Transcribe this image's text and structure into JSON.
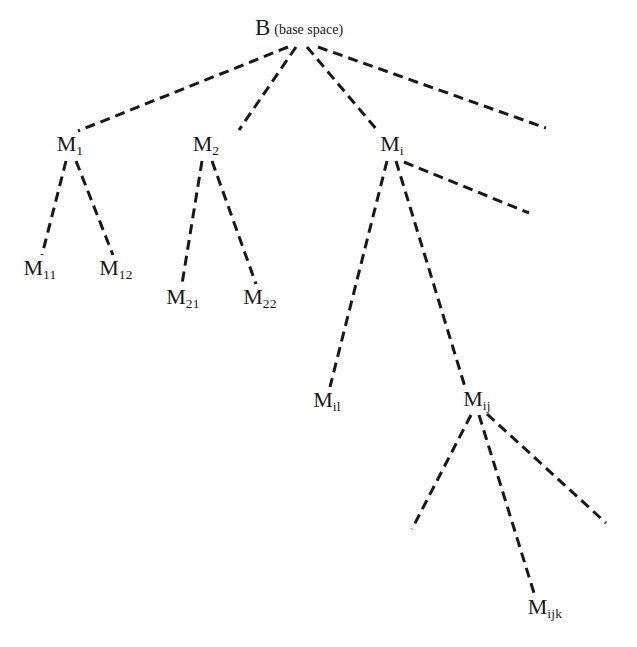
{
  "diagram": {
    "type": "tree",
    "background_color": "#ffffff",
    "edge_color": "#18181a",
    "text_color": "#18181a",
    "edge_style": "dashed",
    "edge_width": 3,
    "dash_pattern": "10 6"
  },
  "nodes": {
    "root": {
      "symbol": "B",
      "subscript": "",
      "annotation": "(base space)",
      "x": 299,
      "y": 27
    },
    "m1": {
      "symbol": "M",
      "subscript": "1",
      "annotation": "",
      "x": 70,
      "y": 145
    },
    "m2": {
      "symbol": "M",
      "subscript": "2",
      "annotation": "",
      "x": 206,
      "y": 145
    },
    "mi": {
      "symbol": "M",
      "subscript": "i",
      "annotation": "",
      "x": 392,
      "y": 145
    },
    "m11": {
      "symbol": "M",
      "subscript": "11",
      "annotation": "",
      "x": 40,
      "y": 269
    },
    "m12": {
      "symbol": "M",
      "subscript": "12",
      "annotation": "",
      "x": 116,
      "y": 269
    },
    "m21": {
      "symbol": "M",
      "subscript": "21",
      "annotation": "",
      "x": 183,
      "y": 298
    },
    "m22": {
      "symbol": "M",
      "subscript": "22",
      "annotation": "",
      "x": 260,
      "y": 298
    },
    "mil": {
      "symbol": "M",
      "subscript": "il",
      "annotation": "",
      "x": 327,
      "y": 401
    },
    "mij": {
      "symbol": "M",
      "subscript": "ij",
      "annotation": "",
      "x": 477,
      "y": 400
    },
    "mijk": {
      "symbol": "M",
      "subscript": "ijk",
      "annotation": "",
      "x": 545,
      "y": 608
    }
  },
  "edges": [
    {
      "name": "edge-root-to-m1",
      "from": "root",
      "to": "m1",
      "x1": 288,
      "y1": 47,
      "x2": 78,
      "y2": 131,
      "labeled_target": true
    },
    {
      "name": "edge-root-to-m2",
      "from": "root",
      "to": "m2",
      "x1": 296,
      "y1": 47,
      "x2": 239,
      "y2": 130,
      "labeled_target": true
    },
    {
      "name": "edge-root-to-mi",
      "from": "root",
      "to": "mi",
      "x1": 307,
      "y1": 47,
      "x2": 377,
      "y2": 130,
      "labeled_target": true
    },
    {
      "name": "edge-root-to-continuation",
      "from": "root",
      "to": "",
      "x1": 318,
      "y1": 47,
      "x2": 546,
      "y2": 128,
      "labeled_target": false
    },
    {
      "name": "edge-m1-to-m11",
      "from": "m1",
      "to": "m11",
      "x1": 66,
      "y1": 161,
      "x2": 42,
      "y2": 255,
      "labeled_target": true
    },
    {
      "name": "edge-m1-to-m12",
      "from": "m1",
      "to": "m12",
      "x1": 76,
      "y1": 161,
      "x2": 113,
      "y2": 255,
      "labeled_target": true
    },
    {
      "name": "edge-m2-to-m21",
      "from": "m2",
      "to": "m21",
      "x1": 202,
      "y1": 161,
      "x2": 182,
      "y2": 284,
      "labeled_target": true
    },
    {
      "name": "edge-m2-to-m22",
      "from": "m2",
      "to": "m22",
      "x1": 212,
      "y1": 161,
      "x2": 256,
      "y2": 284,
      "labeled_target": true
    },
    {
      "name": "edge-mi-to-mil",
      "from": "mi",
      "to": "mil",
      "x1": 387,
      "y1": 161,
      "x2": 330,
      "y2": 387,
      "labeled_target": true
    },
    {
      "name": "edge-mi-to-mij",
      "from": "mi",
      "to": "mij",
      "x1": 396,
      "y1": 161,
      "x2": 465,
      "y2": 387,
      "labeled_target": true
    },
    {
      "name": "edge-mi-to-continuation",
      "from": "mi",
      "to": "",
      "x1": 404,
      "y1": 162,
      "x2": 529,
      "y2": 213,
      "labeled_target": false
    },
    {
      "name": "edge-mij-to-continuation-left",
      "from": "mij",
      "to": "",
      "x1": 471,
      "y1": 415,
      "x2": 412,
      "y2": 529,
      "labeled_target": false
    },
    {
      "name": "edge-mij-to-mijk",
      "from": "mij",
      "to": "mijk",
      "x1": 479,
      "y1": 415,
      "x2": 534,
      "y2": 593,
      "labeled_target": true
    },
    {
      "name": "edge-mij-to-continuation-right",
      "from": "mij",
      "to": "",
      "x1": 487,
      "y1": 414,
      "x2": 606,
      "y2": 523,
      "labeled_target": false
    }
  ]
}
